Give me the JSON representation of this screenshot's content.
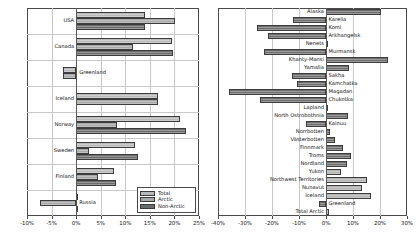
{
  "figure": {
    "panels": [
      "left",
      "right"
    ]
  },
  "left_panel": {
    "legend": {
      "entries": [
        {
          "label": "Total",
          "color": "#b9b9b9"
        },
        {
          "label": "Arctic",
          "color": "#a8a8a8"
        },
        {
          "label": "Non-Arctic",
          "color": "#6b6b6b"
        }
      ]
    },
    "axis": {
      "ticks": [
        "-10%",
        "-5%",
        "0%",
        "5%",
        "10%",
        "15%",
        "20%",
        "25%"
      ],
      "min": -10,
      "max": 25
    }
  },
  "right_panel": {
    "axis": {
      "ticks": [
        "-40%",
        "-30%",
        "-20%",
        "-10%",
        "0%",
        "10%",
        "20%",
        "30%"
      ],
      "min": -40,
      "max": 30
    }
  },
  "chart_data": [
    {
      "type": "bar",
      "orientation": "horizontal",
      "title": "",
      "xlabel": "",
      "ylabel": "",
      "xlim": [
        -10,
        25
      ],
      "xticks": [
        -10,
        -5,
        0,
        5,
        10,
        15,
        20,
        25
      ],
      "xticklabels": [
        "-10%",
        "-5%",
        "0%",
        "5%",
        "10%",
        "15%",
        "20%",
        "25%"
      ],
      "grid": true,
      "legend": [
        "Total",
        "Arctic",
        "Non-Arctic"
      ],
      "legend_position": "lower right",
      "categories": [
        "USA",
        "Canada",
        "Greenland",
        "Iceland",
        "Norway",
        "Sweden",
        "Finland",
        "Russia"
      ],
      "series": [
        {
          "name": "Total",
          "values": [
            14.0,
            19.6,
            -2.6,
            16.6,
            21.2,
            12.0,
            7.8,
            0.4
          ]
        },
        {
          "name": "Arctic",
          "values": [
            20.2,
            11.6,
            -2.6,
            16.6,
            8.3,
            2.6,
            4.4,
            -7.3
          ]
        },
        {
          "name": "Non-Arctic",
          "values": [
            14.0,
            19.7,
            null,
            null,
            22.4,
            12.5,
            8.1,
            0.4
          ]
        }
      ]
    },
    {
      "type": "bar",
      "orientation": "horizontal",
      "title": "",
      "xlabel": "",
      "ylabel": "",
      "xlim": [
        -40,
        30
      ],
      "xticks": [
        -40,
        -30,
        -20,
        -10,
        0,
        10,
        20,
        30
      ],
      "xticklabels": [
        "-40%",
        "-30%",
        "-20%",
        "-10%",
        "0%",
        "10%",
        "20%",
        "30%"
      ],
      "grid": true,
      "categories": [
        "Alaska",
        "Karelia",
        "Komi",
        "Arkhangelsk",
        "Nenets",
        "Murmansk",
        "Khanty-Mansi",
        "Yamalia",
        "Sakha",
        "Kamchatka",
        "Magadan",
        "Chukotka",
        "Lapland",
        "North Ostrobothnia",
        "Kainuu",
        "Norrbotten",
        "Västerbotten",
        "Finnmark",
        "Troms",
        "Nordland",
        "Yukon",
        "Northwest Territories",
        "Nunavut",
        "Iceland",
        "Greenland",
        "Total Arctic"
      ],
      "values": [
        20.4,
        -12.1,
        -25.6,
        -21.6,
        0.4,
        -22.8,
        23.1,
        8.6,
        -12.5,
        -10.6,
        -36.0,
        -24.6,
        0.6,
        8.2,
        -7.3,
        1.4,
        3.2,
        6.4,
        9.3,
        7.6,
        5.4,
        15.0,
        13.4,
        16.6,
        -2.6,
        1.0
      ],
      "shades": [
        "dark",
        "dark",
        "dark",
        "dark",
        "dark",
        "dark",
        "dark",
        "dark",
        "dark",
        "dark",
        "dark",
        "dark",
        "dark",
        "dark",
        "dark",
        "dark",
        "dark",
        "dark",
        "dark",
        "dark",
        "light",
        "light",
        "light",
        "light",
        "dark",
        "light"
      ]
    }
  ]
}
